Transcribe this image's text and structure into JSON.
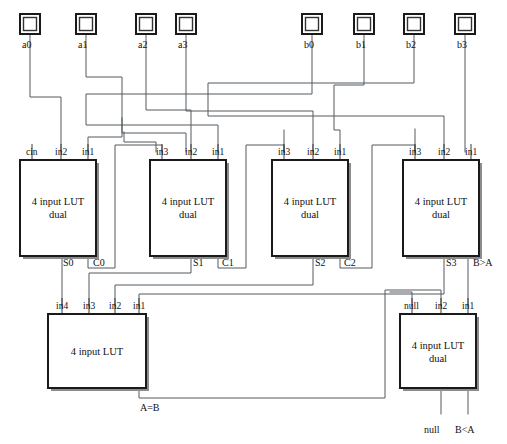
{
  "diagram": {
    "width": 507,
    "height": 444,
    "colors": {
      "wire": "#555b5f",
      "box_border": "#1a1a1a",
      "shadow": "#8c8c8c",
      "background": "#ffffff",
      "text": "#111111"
    }
  },
  "input_pads": [
    {
      "label": "a0",
      "x": 20,
      "y": 14,
      "size": 20,
      "label_x": 22,
      "label_y": 40
    },
    {
      "label": "a1",
      "x": 76,
      "y": 14,
      "size": 20,
      "label_x": 78,
      "label_y": 40
    },
    {
      "label": "a2",
      "x": 136,
      "y": 14,
      "size": 20,
      "label_x": 138,
      "label_y": 40
    },
    {
      "label": "a3",
      "x": 176,
      "y": 14,
      "size": 20,
      "label_x": 178,
      "label_y": 40
    },
    {
      "label": "b0",
      "x": 302,
      "y": 14,
      "size": 20,
      "label_x": 304,
      "label_y": 40
    },
    {
      "label": "b1",
      "x": 354,
      "y": 14,
      "size": 20,
      "label_x": 356,
      "label_y": 40
    },
    {
      "label": "b2",
      "x": 404,
      "y": 14,
      "size": 20,
      "label_x": 406,
      "label_y": 40
    },
    {
      "label": "b3",
      "x": 455,
      "y": 14,
      "size": 20,
      "label_x": 457,
      "label_y": 40
    }
  ],
  "luts": [
    {
      "id": "lut0",
      "title_line1": "4 input LUT",
      "title_line2": "dual",
      "x": 20,
      "y": 160,
      "w": 76,
      "h": 96,
      "inputs": [
        {
          "label": "cin",
          "x": 32
        },
        {
          "label": "in2",
          "x": 61
        },
        {
          "label": "in1",
          "x": 88
        }
      ],
      "outputs": [
        {
          "label": "S0",
          "x": 61
        },
        {
          "label": "C0",
          "x": 88
        }
      ]
    },
    {
      "id": "lut1",
      "title_line1": "4 input LUT",
      "title_line2": "dual",
      "x": 150,
      "y": 160,
      "w": 76,
      "h": 96,
      "inputs": [
        {
          "label": "in3",
          "x": 162
        },
        {
          "label": "in2",
          "x": 191
        },
        {
          "label": "in1",
          "x": 218
        }
      ],
      "outputs": [
        {
          "label": "S1",
          "x": 191
        },
        {
          "label": "C1",
          "x": 218
        }
      ]
    },
    {
      "id": "lut2",
      "title_line1": "4 input LUT",
      "title_line2": "dual",
      "x": 272,
      "y": 160,
      "w": 76,
      "h": 96,
      "inputs": [
        {
          "label": "in3",
          "x": 284
        },
        {
          "label": "in2",
          "x": 313
        },
        {
          "label": "in1",
          "x": 340
        }
      ],
      "outputs": [
        {
          "label": "S2",
          "x": 313
        },
        {
          "label": "C2",
          "x": 340
        }
      ]
    },
    {
      "id": "lut3",
      "title_line1": "4 input LUT",
      "title_line2": "dual",
      "x": 403,
      "y": 160,
      "w": 76,
      "h": 96,
      "inputs": [
        {
          "label": "in3",
          "x": 415
        },
        {
          "label": "in2",
          "x": 444
        },
        {
          "label": "in1",
          "x": 471
        }
      ],
      "outputs": [
        {
          "label": "S3",
          "x": 444
        },
        {
          "label": "B>A",
          "x": 471
        }
      ]
    },
    {
      "id": "lut4",
      "title_line1": "4 input LUT",
      "title_line2": "",
      "x": 48,
      "y": 314,
      "w": 98,
      "h": 74,
      "inputs": [
        {
          "label": "in4",
          "x": 62
        },
        {
          "label": "in3",
          "x": 89
        },
        {
          "label": "in2",
          "x": 115
        },
        {
          "label": "in1",
          "x": 139
        }
      ],
      "outputs": [
        {
          "label": "A=B",
          "x": 139
        }
      ]
    },
    {
      "id": "lut5",
      "title_line1": "4 input LUT",
      "title_line2": "dual",
      "x": 400,
      "y": 314,
      "w": 76,
      "h": 74,
      "inputs": [
        {
          "label": "null",
          "x": 412
        },
        {
          "label": "in2",
          "x": 441
        },
        {
          "label": "in1",
          "x": 468
        }
      ],
      "outputs": [
        {
          "label": "null",
          "x": 441
        },
        {
          "label": "B<A",
          "x": 468
        }
      ]
    }
  ],
  "port_labels": [
    {
      "text": "cin",
      "x": 26,
      "y": 148
    },
    {
      "text": "in2",
      "x": 55,
      "y": 148
    },
    {
      "text": "in1",
      "x": 82,
      "y": 148
    },
    {
      "text": "in3",
      "x": 156,
      "y": 148
    },
    {
      "text": "in2",
      "x": 185,
      "y": 148
    },
    {
      "text": "in1",
      "x": 212,
      "y": 148
    },
    {
      "text": "in3",
      "x": 278,
      "y": 148
    },
    {
      "text": "in2",
      "x": 307,
      "y": 148
    },
    {
      "text": "in1",
      "x": 334,
      "y": 148
    },
    {
      "text": "in3",
      "x": 409,
      "y": 148
    },
    {
      "text": "in2",
      "x": 438,
      "y": 148
    },
    {
      "text": "in1",
      "x": 465,
      "y": 148
    },
    {
      "text": "in4",
      "x": 56,
      "y": 302
    },
    {
      "text": "in3",
      "x": 83,
      "y": 302
    },
    {
      "text": "in2",
      "x": 109,
      "y": 302
    },
    {
      "text": "in1",
      "x": 133,
      "y": 302
    },
    {
      "text": "null",
      "x": 404,
      "y": 302
    },
    {
      "text": "in2",
      "x": 435,
      "y": 302
    },
    {
      "text": "in1",
      "x": 462,
      "y": 302
    }
  ],
  "signal_labels": [
    {
      "text": "S0",
      "x": 63,
      "y": 258
    },
    {
      "text": "C0",
      "x": 93,
      "y": 258
    },
    {
      "text": "S1",
      "x": 193,
      "y": 258
    },
    {
      "text": "C1",
      "x": 222,
      "y": 258
    },
    {
      "text": "S2",
      "x": 315,
      "y": 258
    },
    {
      "text": "C2",
      "x": 344,
      "y": 258
    },
    {
      "text": "S3",
      "x": 446,
      "y": 258
    },
    {
      "text": "B>A",
      "x": 473,
      "y": 258
    },
    {
      "text": "A=B",
      "x": 140,
      "y": 403
    },
    {
      "text": "null",
      "x": 424,
      "y": 425
    },
    {
      "text": "B<A",
      "x": 455,
      "y": 425
    }
  ],
  "nets": [
    {
      "name": "a0-to-lut0-in2",
      "from": "a0",
      "to": "lut0.in2"
    },
    {
      "name": "a1-to-lut0-in1",
      "from": "a1",
      "to": "lut0.in1"
    },
    {
      "name": "a2-to-lut1-in2",
      "from": "a2",
      "to": "lut1.in2"
    },
    {
      "name": "a3-to-lut2-in2",
      "from": "a3",
      "to": "lut2.in2"
    },
    {
      "name": "b0-to-lut1-in1",
      "from": "b0",
      "to": "lut1.in1"
    },
    {
      "name": "b1-to-lut2-in1",
      "from": "b1",
      "to": "lut2.in1"
    },
    {
      "name": "b2-to-lut3-in2",
      "from": "b2",
      "to": "lut3.in2"
    },
    {
      "name": "b3-to-lut3-in1",
      "from": "b3",
      "to": "lut3.in1"
    },
    {
      "name": "carry-c0-to-lut1-in3",
      "from": "lut0.C0",
      "to": "lut1.in3"
    },
    {
      "name": "carry-c1-to-lut2-in3",
      "from": "lut1.C1",
      "to": "lut2.in3"
    },
    {
      "name": "carry-c2-to-lut3-in3",
      "from": "lut2.C2",
      "to": "lut3.in3"
    },
    {
      "name": "s0-to-lut4-in4",
      "from": "lut0.S0",
      "to": "lut4.in4"
    },
    {
      "name": "s1-to-lut4-in3",
      "from": "lut1.S1",
      "to": "lut4.in3"
    },
    {
      "name": "s2-to-lut4-in2",
      "from": "lut2.S2",
      "to": "lut4.in2"
    },
    {
      "name": "s3-to-lut4-in1",
      "from": "lut3.S3",
      "to": "lut4.in1"
    },
    {
      "name": "bgta-to-lut5-in1",
      "from": "lut3.B>A",
      "to": "lut5.in1"
    },
    {
      "name": "aeqb-to-lut5-in2",
      "from": "lut4.A=B",
      "to": "lut5.in2"
    }
  ]
}
